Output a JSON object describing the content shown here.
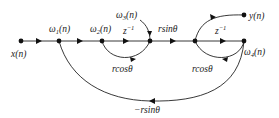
{
  "diagram": {
    "type": "signal-flow-graph",
    "nodes": [
      {
        "id": "x",
        "label": "x(n)"
      },
      {
        "id": "w1",
        "label": "ω1(n)"
      },
      {
        "id": "w2",
        "label": "ω2(n)"
      },
      {
        "id": "w3",
        "label": "ω3(n)"
      },
      {
        "id": "mid",
        "label": ""
      },
      {
        "id": "w4",
        "label": "ω4(n)"
      },
      {
        "id": "y",
        "label": "y(n)"
      }
    ],
    "labels": {
      "x": "x(n)",
      "w1": "ω",
      "w1_sub": "1",
      "w2": "ω",
      "w2_sub": "2",
      "w3": "ω",
      "w3_sub": "3",
      "w4": "ω",
      "w4_sub": "4",
      "n_suffix": "(n)",
      "y": "y(n)",
      "z_inv_1": "z",
      "z_inv_2": "z",
      "z_exp": "−1",
      "r_sin": "rsinθ",
      "r_cos_1": "rcosθ",
      "r_cos_2": "rcosθ",
      "neg_r_sin": "−rsinθ"
    },
    "edges": [
      {
        "from": "x",
        "to": "w1",
        "gain": ""
      },
      {
        "from": "w1",
        "to": "w2",
        "gain": ""
      },
      {
        "from": "w2",
        "to": "w3",
        "gain": "z^-1"
      },
      {
        "from": "w2",
        "to": "w3",
        "gain": "rcosθ"
      },
      {
        "from": "w3",
        "to": "mid",
        "gain": "rsinθ"
      },
      {
        "from": "mid",
        "to": "w4",
        "gain": "z^-1"
      },
      {
        "from": "mid",
        "to": "y",
        "gain": ""
      },
      {
        "from": "w4",
        "to": "mid",
        "gain": "rcosθ"
      },
      {
        "from": "w4",
        "to": "w1",
        "gain": "−rsinθ"
      }
    ]
  }
}
